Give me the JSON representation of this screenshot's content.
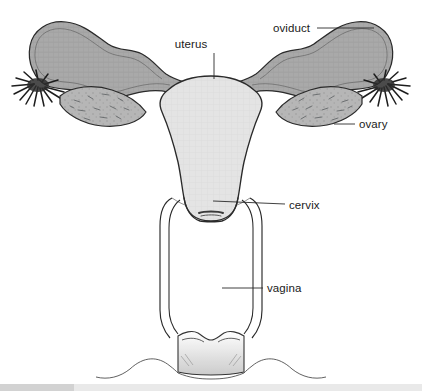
{
  "diagram": {
    "background_color": "#ffffff",
    "line_color": "#2a2a2a",
    "labels": [
      {
        "id": "uterus",
        "text": "uterus",
        "text_x": 191,
        "text_y": 48,
        "anchor": "middle",
        "leader": "M 214 53 L 214 79"
      },
      {
        "id": "oviduct",
        "text": "oviduct",
        "text_x": 273,
        "text_y": 32,
        "anchor": "start",
        "leader": "M 317 28 L 374 28"
      },
      {
        "id": "ovary",
        "text": "ovary",
        "text_x": 359,
        "text_y": 128,
        "anchor": "start",
        "leader": "M 334 124 L 355 124"
      },
      {
        "id": "cervix",
        "text": "cervix",
        "text_x": 289,
        "text_y": 209,
        "anchor": "start",
        "leader": "M 213 201 L 285 204"
      },
      {
        "id": "vagina",
        "text": "vagina",
        "text_x": 267,
        "text_y": 292,
        "anchor": "start",
        "leader": "M 222 288 L 263 288"
      }
    ],
    "parts": {
      "uterus": {
        "name": "uterus",
        "fill": "#e3e3e3",
        "stroke": "#2a2a2a"
      },
      "oviduct_left": {
        "name": "left-oviduct",
        "fill": "#a9a9a9",
        "stroke": "#2a2a2a"
      },
      "oviduct_right": {
        "name": "right-oviduct",
        "fill": "#a9a9a9",
        "stroke": "#2a2a2a"
      },
      "ovary_left": {
        "name": "left-ovary",
        "fill": "#b4b4b4",
        "stroke": "#2a2a2a"
      },
      "ovary_right": {
        "name": "right-ovary",
        "fill": "#b4b4b4",
        "stroke": "#2a2a2a"
      },
      "fimbriae_left": {
        "name": "left-fimbriae",
        "fill": "#1d1d1d",
        "stroke": "#1d1d1d"
      },
      "fimbriae_right": {
        "name": "right-fimbriae",
        "fill": "#1d1d1d",
        "stroke": "#1d1d1d"
      },
      "cervix": {
        "name": "cervix",
        "fill": "#e3e3e3",
        "stroke": "#2a2a2a"
      },
      "cervical_os": {
        "name": "cervical-os",
        "fill": "#3a3a3a",
        "stroke": "#222222"
      },
      "vagina": {
        "name": "vagina",
        "fill": "#ffffff",
        "stroke": "#2a2a2a"
      },
      "perineum": {
        "name": "perineum",
        "fill": "none",
        "stroke": "#555555"
      }
    },
    "footer_bar": {
      "name": "footer-bar",
      "light_color": "#e9e9e9",
      "dark_color": "#d2d2d2"
    }
  }
}
